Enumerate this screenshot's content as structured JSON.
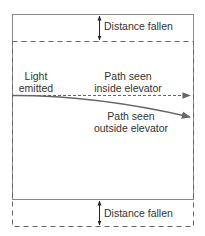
{
  "diagram": {
    "type": "light-in-falling-elevator",
    "labels": {
      "distance_fallen_top": "Distance fallen",
      "distance_fallen_bottom": "Distance fallen",
      "light_emitted_line1": "Light",
      "light_emitted_line2": "emitted",
      "path_inside_line1": "Path seen",
      "path_inside_line2": "inside elevator",
      "path_outside_line1": "Path seen",
      "path_outside_line2": "outside elevator"
    },
    "colors": {
      "box_line": "#888888",
      "dashed_line": "#666666",
      "arrow": "#666666",
      "text": "#333333"
    }
  }
}
